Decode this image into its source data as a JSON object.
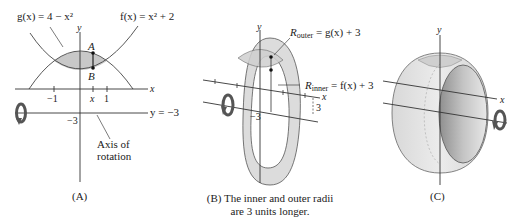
{
  "panel_a": {
    "caption": "(A)",
    "g_label": "g(x) = 4 − x²",
    "f_label": "f(x) = x² + 2",
    "point_a": "A",
    "point_b": "B",
    "x_axis_label": "x",
    "y_axis_label": "y",
    "tick_neg1": "−1",
    "tick_x": "x",
    "tick_1": "1",
    "tick_neg3": "−3",
    "axis_line_label": "y = −3",
    "axis_of_rotation_line1": "Axis of",
    "axis_of_rotation_line2": "rotation"
  },
  "panel_b": {
    "caption_line1": "(B) The inner and outer radii",
    "caption_line2": "are 3 units longer.",
    "y_axis_label": "y",
    "x_axis_label": "x",
    "r_outer_label": "R",
    "r_outer_sub": "outer",
    "r_outer_expr": " = g(x) + 3",
    "r_inner_label": "R",
    "r_inner_sub": "inner",
    "r_inner_expr": " = f(x) + 3",
    "tick_neg3": "−3",
    "dim_3": "3"
  },
  "panel_c": {
    "caption": "(C)",
    "y_axis_label": "y",
    "x_axis_label": "x"
  },
  "colors": {
    "region_fill": "#c8c8c8",
    "ring_fill": "#dcdcdc",
    "solid_light": "#e6e6e6",
    "solid_dark": "#a8a8a8",
    "line": "#333333",
    "arrow": "#555555"
  }
}
